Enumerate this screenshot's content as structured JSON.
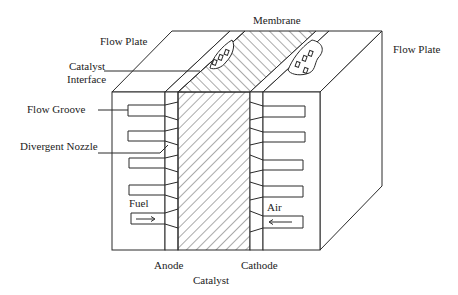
{
  "diagram": {
    "labels": {
      "membrane": "Membrane",
      "flow_plate_left": "Flow Plate",
      "flow_plate_right": "Flow Plate",
      "catalyst_interface_line1": "Catalyst",
      "catalyst_interface_line2": "Interface",
      "flow_groove": "Flow Groove",
      "divergent_nozzle": "Divergent Nozzle",
      "fuel": "Fuel",
      "air": "Air",
      "anode": "Anode",
      "cathode": "Cathode",
      "catalyst": "Catalyst"
    },
    "flows": [
      {
        "name": "Fuel",
        "direction": "right"
      },
      {
        "name": "Air",
        "direction": "left"
      }
    ],
    "groove_count_per_side": 4,
    "colors": {
      "line": "#2a2a2a",
      "background": "#ffffff",
      "text": "#222222"
    }
  }
}
